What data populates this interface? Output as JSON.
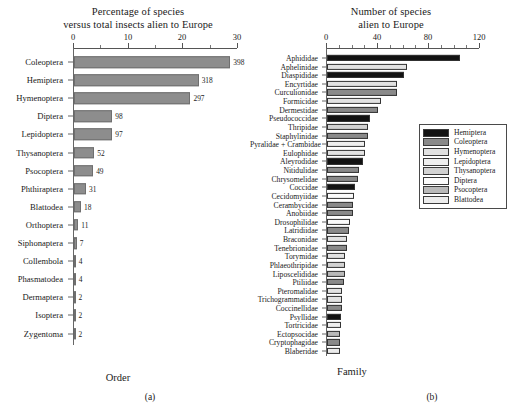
{
  "figure": {
    "panel_a_letter": "(a)",
    "panel_b_letter": "(b)"
  },
  "panel_a": {
    "title_line1": "Percentage of species",
    "title_line2": "versus total insects alien to Europe",
    "axis_caption": "Order",
    "bar_color": "#8d8d8d",
    "bar_edge": "#6f6f6f"
  },
  "panel_b": {
    "title_line1": "Number of species",
    "title_line2": "alien to Europe",
    "axis_caption": "Family"
  },
  "legend": {
    "items": [
      {
        "label": "Hemiptera",
        "color": "#121212"
      },
      {
        "label": "Coleoptera",
        "color": "#8a8a8a"
      },
      {
        "label": "Hymenoptera",
        "color": "#e2e2e2"
      },
      {
        "label": "Lepidoptera",
        "color": "#efefef"
      },
      {
        "label": "Thysanoptera",
        "color": "#d2d2d2"
      },
      {
        "label": "Diptera",
        "color": "#fbfbfb"
      },
      {
        "label": "Psocoptera",
        "color": "#b9b9b9"
      },
      {
        "label": "Blattodea",
        "color": "#ececec"
      }
    ]
  },
  "chart_data": [
    {
      "type": "bar",
      "orientation": "horizontal",
      "panel": "(a)",
      "title": "Percentage of species versus total insects alien to Europe",
      "xlabel": "",
      "ylabel": "Order",
      "xlim": [
        0,
        30
      ],
      "xticks": [
        0,
        10,
        20,
        30
      ],
      "xtick_labels": [
        "0",
        "10",
        "20",
        "30"
      ],
      "minor_tick_step": 5,
      "grid": false,
      "value_label_note": "bar end labels are absolute species counts; bar length is percentage of total alien insects",
      "categories": [
        "Coleoptera",
        "Hemiptera",
        "Hymenoptera",
        "Diptera",
        "Lepidoptera",
        "Thysanoptera",
        "Psocoptera",
        "Phthiraptera",
        "Blattodea",
        "Orthoptera",
        "Siphonaptera",
        "Collembola",
        "Phasmatodea",
        "Dermaptera",
        "Isoptera",
        "Zygentoma"
      ],
      "values": [
        28.6,
        22.8,
        21.3,
        7.0,
        7.0,
        3.7,
        3.5,
        2.2,
        1.3,
        0.8,
        0.5,
        0.3,
        0.3,
        0.15,
        0.15,
        0.15
      ],
      "data_labels": [
        "398",
        "318",
        "297",
        "98",
        "97",
        "52",
        "49",
        "31",
        "18",
        "11",
        "7",
        "4",
        "4",
        "2",
        "2",
        "2"
      ]
    },
    {
      "type": "bar",
      "orientation": "horizontal",
      "panel": "(b)",
      "title": "Number of species alien to Europe",
      "xlabel": "",
      "ylabel": "Family",
      "xlim": [
        0,
        120
      ],
      "xticks": [
        0,
        40,
        80,
        120
      ],
      "xtick_labels": [
        "0",
        "40",
        "80",
        "120"
      ],
      "minor_tick_step": 10,
      "grid": false,
      "legend_position": "middle-right",
      "series_key": "order",
      "categories": [
        "Aphididae",
        "Aphelinidae",
        "Diaspididae",
        "Encyrtidae",
        "Curculionidae",
        "Formicidae",
        "Dermestidae",
        "Pseudococcidae",
        "Thripidae",
        "Staphylinidae",
        "Pyralidae + Crambidae",
        "Eulophidae",
        "Aleyrodidae",
        "Nitidulidae",
        "Chrysomelidae",
        "Coccidae",
        "Cecidomyiidae",
        "Cerambycidae",
        "Anobiidae",
        "Drosophilidae",
        "Latridiidae",
        "Braconidae",
        "Tenebrionidae",
        "Torymidae",
        "Phlaeothripidae",
        "Liposcelididae",
        "Ptiliidae",
        "Pteromalidae",
        "Trichogrammatidae",
        "Coccinellidae",
        "Psyllidae",
        "Tortricidae",
        "Ectopsocidae",
        "Cryptophagidae",
        "Blaberidae"
      ],
      "values": [
        104,
        63,
        60,
        55,
        55,
        42,
        40,
        34,
        32,
        32,
        30,
        30,
        28,
        25,
        24,
        22,
        21,
        20,
        20,
        18,
        17,
        16,
        16,
        14,
        14,
        14,
        13,
        12,
        12,
        12,
        11,
        11,
        10,
        10,
        10
      ],
      "orders": [
        "Hemiptera",
        "Hymenoptera",
        "Hemiptera",
        "Hymenoptera",
        "Coleoptera",
        "Hymenoptera",
        "Coleoptera",
        "Hemiptera",
        "Thysanoptera",
        "Coleoptera",
        "Lepidoptera",
        "Hymenoptera",
        "Hemiptera",
        "Coleoptera",
        "Coleoptera",
        "Hemiptera",
        "Diptera",
        "Coleoptera",
        "Coleoptera",
        "Diptera",
        "Coleoptera",
        "Hymenoptera",
        "Coleoptera",
        "Hymenoptera",
        "Thysanoptera",
        "Psocoptera",
        "Coleoptera",
        "Hymenoptera",
        "Hymenoptera",
        "Coleoptera",
        "Hemiptera",
        "Lepidoptera",
        "Psocoptera",
        "Coleoptera",
        "Blattodea"
      ]
    }
  ]
}
